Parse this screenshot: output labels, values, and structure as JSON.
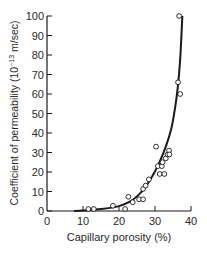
{
  "chart_data": {
    "type": "scatter",
    "title": "",
    "xlabel": "Capillary porosity (%)",
    "ylabel": "Coefficient of permeability (10⁻¹³ m/sec)",
    "ylabel_parts": {
      "prefix": "Coefficient of permeability (10",
      "exponent": "−13",
      "suffix": " m/sec)"
    },
    "xlim": [
      0,
      40
    ],
    "ylim": [
      0,
      100
    ],
    "x_ticks": [
      0,
      10,
      20,
      30,
      40
    ],
    "y_ticks": [
      0,
      10,
      20,
      30,
      40,
      50,
      60,
      70,
      80,
      90,
      100
    ],
    "grid": false,
    "legend": null,
    "series": [
      {
        "name": "Measured",
        "marker": "open-circle",
        "points": [
          [
            11.5,
            1
          ],
          [
            13.0,
            1
          ],
          [
            18.3,
            2.7
          ],
          [
            21.7,
            1
          ],
          [
            22.6,
            7.3
          ],
          [
            23.8,
            4.5
          ],
          [
            25.6,
            6
          ],
          [
            26.7,
            6
          ],
          [
            26.7,
            11.3
          ],
          [
            27.4,
            13
          ],
          [
            28.3,
            16.2
          ],
          [
            30.3,
            33
          ],
          [
            30.8,
            23
          ],
          [
            31.3,
            19
          ],
          [
            31.9,
            23
          ],
          [
            32.1,
            25
          ],
          [
            32.6,
            19
          ],
          [
            33.0,
            27
          ],
          [
            33.5,
            29
          ],
          [
            33.9,
            31
          ],
          [
            34.0,
            29
          ],
          [
            36.4,
            66
          ],
          [
            37.0,
            60
          ],
          [
            36.7,
            100
          ]
        ]
      },
      {
        "name": "Fitted curve",
        "marker": "line",
        "points": [
          [
            7.5,
            0
          ],
          [
            10,
            0.3
          ],
          [
            15,
            1
          ],
          [
            20,
            2.5
          ],
          [
            23,
            4.8
          ],
          [
            25,
            7.5
          ],
          [
            27,
            11.5
          ],
          [
            29,
            17
          ],
          [
            31,
            24
          ],
          [
            33,
            33
          ],
          [
            34.5,
            42
          ],
          [
            35.5,
            52
          ],
          [
            36.3,
            63
          ],
          [
            37,
            78
          ],
          [
            37.6,
            100
          ]
        ]
      }
    ]
  },
  "colors": {
    "ink": "#1a1a1a",
    "background": "#ffffff"
  }
}
